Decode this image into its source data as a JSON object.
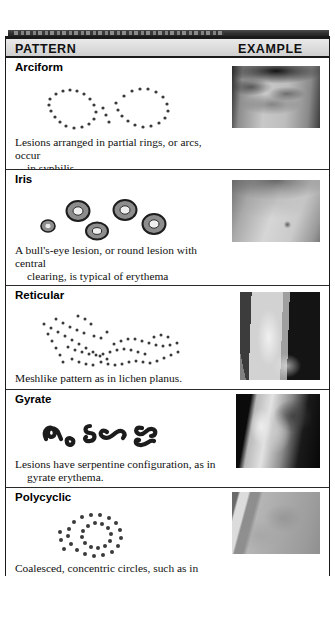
{
  "table": {
    "headers": {
      "pattern": "PATTERN",
      "example": "EXAMPLE"
    },
    "rows": [
      {
        "heading": "Arciform",
        "caption_line1": "Lesions arranged in partial rings, or arcs, occur",
        "caption_line2": "in syphilis.",
        "diagram_name": "arciform-dot-diagram",
        "photo_name": "arciform-skin-photo"
      },
      {
        "heading": "Iris",
        "caption_line1": "A bull's-eye lesion, or round lesion with central",
        "caption_line2": "clearing, is typical of erythema multiforme",
        "caption_line3": "and Lyme disease.",
        "diagram_name": "iris-target-lesion-diagram",
        "photo_name": "iris-skin-photo"
      },
      {
        "heading": "Reticular",
        "caption_line1": "Meshlike pattern as in lichen planus.",
        "diagram_name": "reticular-dot-diagram",
        "photo_name": "reticular-ankle-photo"
      },
      {
        "heading": "Gyrate",
        "caption_line1": "Lesions have serpentine configuration, as in",
        "caption_line2": "gyrate erythema.",
        "diagram_name": "gyrate-serpentine-diagram",
        "photo_name": "gyrate-face-photo"
      },
      {
        "heading": "Polycyclic",
        "caption_line1": "Coalesced, concentric circles, such as in urticaria.",
        "diagram_name": "polycyclic-dot-diagram",
        "photo_name": "polycyclic-skin-photo"
      }
    ]
  },
  "colors": {
    "rule": "#1a1a1a",
    "header_fill": "#dcdcdc",
    "text": "#111111",
    "dot": "#3a3a3a"
  }
}
